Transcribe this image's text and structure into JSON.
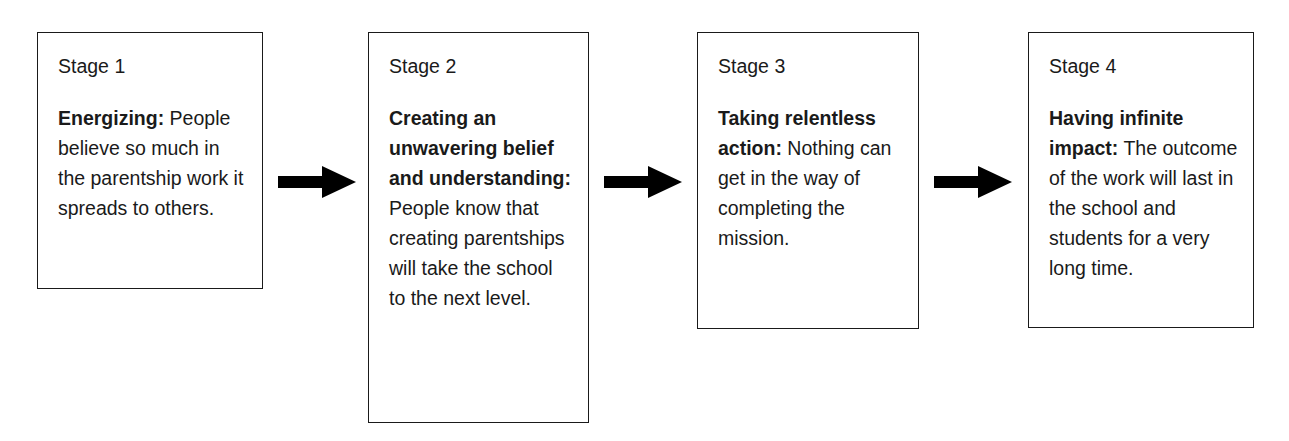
{
  "diagram": {
    "orientation": "horizontal-left-to-right",
    "box_border_color": "#1a1a1a",
    "box_fill_color": "#ffffff",
    "arrow_color": "#000000",
    "text_color": "#1a1a1a",
    "stages": [
      {
        "label": "Stage 1",
        "lead": "Energizing:",
        "body": " People believe so much in the parentship work it spreads to others."
      },
      {
        "label": "Stage 2",
        "lead": "Creating an unwavering belief and understanding:",
        "body": " People know that creating parentships will take the school to the next level."
      },
      {
        "label": "Stage 3",
        "lead": "Taking relentless action:",
        "body": " Nothing can get in the way of completing the mission."
      },
      {
        "label": "Stage 4",
        "lead": "Having infinite impact:",
        "body": " The outcome of the work will last in the school and students for a very long time."
      }
    ],
    "connectors": [
      {
        "name": "arrow-stage1-to-stage2",
        "glyph": "right-arrow"
      },
      {
        "name": "arrow-stage2-to-stage3",
        "glyph": "right-arrow"
      },
      {
        "name": "arrow-stage3-to-stage4",
        "glyph": "right-arrow"
      }
    ]
  }
}
